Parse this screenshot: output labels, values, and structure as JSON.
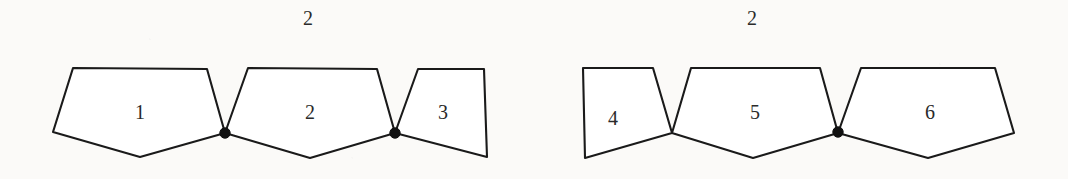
{
  "figure": {
    "background_color": "#fbfaf8",
    "stroke_color": "#1a1a1a",
    "fill_color": "#ffffff",
    "dot_color": "#111111",
    "groups": [
      {
        "name": "left-diagram",
        "group_label": "2",
        "group_label_x": 308,
        "group_label_y": 18,
        "cells": [
          {
            "label": "1",
            "label_x": 140,
            "label_y": 112,
            "points": "73,68 207,69 225,133 140,157 53,132"
          },
          {
            "label": "2",
            "label_x": 310,
            "label_y": 112,
            "points": "248,68 377,69 395,133 310,158 225,133"
          },
          {
            "label": "3",
            "label_x": 443,
            "label_y": 112,
            "points": "418,69 484,69 487,157 395,133"
          }
        ],
        "dots": [
          {
            "x": 225,
            "y": 133,
            "r": 5.2
          },
          {
            "x": 395,
            "y": 133,
            "r": 5.2
          }
        ]
      },
      {
        "name": "right-diagram",
        "group_label": "2",
        "group_label_x": 752,
        "group_label_y": 18,
        "cells": [
          {
            "label": "4",
            "label_x": 613,
            "label_y": 118,
            "points": "583,68 653,68 672,133 585,158"
          },
          {
            "label": "5",
            "label_x": 755,
            "label_y": 112,
            "points": "691,68 820,68 838,133 753,158 672,133"
          },
          {
            "label": "6",
            "label_x": 930,
            "label_y": 112,
            "points": "861,68 995,68 1014,133 928,158 838,133"
          }
        ],
        "dots": [
          {
            "x": 838,
            "y": 132,
            "r": 5.2
          }
        ]
      }
    ]
  }
}
